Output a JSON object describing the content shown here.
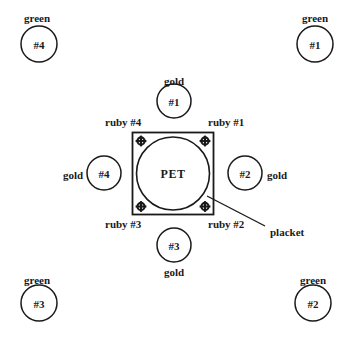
{
  "diagram": {
    "stroke_color": "#1a1a1a",
    "background_color": "#ffffff",
    "center": {
      "label": "PET",
      "shape": "circle-in-square",
      "square": {
        "x": 132,
        "y": 132,
        "width": 82,
        "height": 83
      },
      "circle": {
        "cx": 173,
        "cy": 173.5,
        "r": 37
      }
    },
    "ruby_markers": [
      {
        "name": "ruby #1",
        "label": "ruby #1",
        "marker": {
          "cx": 205,
          "cy": 141
        },
        "label_pos": {
          "x": 208,
          "y": 122
        },
        "label_anchor": "start"
      },
      {
        "name": "ruby #2",
        "label": "ruby #2",
        "marker": {
          "cx": 205,
          "cy": 207
        },
        "label_pos": {
          "x": 208,
          "y": 224
        },
        "label_anchor": "start"
      },
      {
        "name": "ruby #3",
        "label": "ruby #3",
        "marker": {
          "cx": 141,
          "cy": 207
        },
        "label_pos": {
          "x": 138,
          "y": 224
        },
        "label_anchor": "end"
      },
      {
        "name": "ruby #4",
        "label": "ruby #4",
        "marker": {
          "cx": 141,
          "cy": 141
        },
        "label_pos": {
          "x": 138,
          "y": 122
        },
        "label_anchor": "end"
      }
    ],
    "gold_circles": [
      {
        "name": "gold #1",
        "number": "#1",
        "material": "gold",
        "cx": 174,
        "cy": 101,
        "r": 17,
        "label_pos": {
          "x": 174,
          "y": 78
        },
        "label_placement": "above"
      },
      {
        "name": "gold #2",
        "number": "#2",
        "material": "gold",
        "cx": 245,
        "cy": 173,
        "r": 17,
        "label_pos": {
          "x": 277,
          "y": 174
        },
        "label_placement": "right"
      },
      {
        "name": "gold #3",
        "number": "#3",
        "material": "gold",
        "cx": 174,
        "cy": 245,
        "r": 17,
        "label_pos": {
          "x": 174,
          "y": 270
        },
        "label_placement": "below"
      },
      {
        "name": "gold #4",
        "number": "#4",
        "material": "gold",
        "cx": 104,
        "cy": 173,
        "r": 17,
        "label_pos": {
          "x": 73,
          "y": 174
        },
        "label_placement": "left"
      }
    ],
    "green_circles": [
      {
        "name": "green #1",
        "number": "#1",
        "material": "green",
        "cx": 315,
        "cy": 44,
        "r": 18,
        "label_pos": {
          "x": 315,
          "y": 18
        }
      },
      {
        "name": "green #2",
        "number": "#2",
        "material": "green",
        "cx": 313,
        "cy": 303,
        "r": 18,
        "label_pos": {
          "x": 313,
          "y": 279
        }
      },
      {
        "name": "green #3",
        "number": "#3",
        "material": "green",
        "cx": 39,
        "cy": 303,
        "r": 18,
        "label_pos": {
          "x": 37,
          "y": 279
        }
      },
      {
        "name": "green #4",
        "number": "#4",
        "material": "green",
        "cx": 39,
        "cy": 44,
        "r": 18,
        "label_pos": {
          "x": 37,
          "y": 18
        }
      }
    ],
    "callout": {
      "label": "placket",
      "line": {
        "x1": 207,
        "y1": 196,
        "x2": 265,
        "y2": 226
      },
      "label_pos": {
        "x": 271,
        "y": 232
      }
    }
  }
}
